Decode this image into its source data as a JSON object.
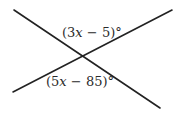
{
  "diagram": {
    "type": "intersecting-lines",
    "canvas": {
      "width": 179,
      "height": 116,
      "background": "#ffffff"
    },
    "line_color": "#222222",
    "line_width": 1.6,
    "lines": [
      {
        "name": "line-descending",
        "x1": 14,
        "y1": 10,
        "x2": 160,
        "y2": 108
      },
      {
        "name": "line-ascending",
        "x1": 13,
        "y1": 92,
        "x2": 172,
        "y2": 10
      }
    ],
    "intersection": {
      "x": 83,
      "y": 56
    },
    "angles": [
      {
        "name": "top-angle",
        "position": "above intersection",
        "open": "(",
        "coef": "3",
        "var": "x",
        "op": " − ",
        "const": "5",
        "close": ")°",
        "text": "(3x − 5)°",
        "x": 62,
        "y": 37
      },
      {
        "name": "bottom-angle",
        "position": "below intersection",
        "open": "(",
        "coef": "5",
        "var": "x",
        "op": " − ",
        "const": "85",
        "close": ")°",
        "text": "(5x − 85)°",
        "x": 46,
        "y": 86
      }
    ]
  }
}
